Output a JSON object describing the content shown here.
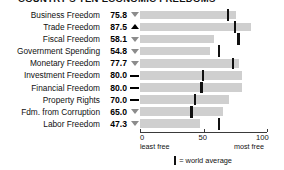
{
  "chart_title": "COUNTRY'S TEN ECONOMIC FREEDOMS",
  "axis": {
    "ticks": [
      {
        "value": 0,
        "label": "0"
      },
      {
        "value": 50,
        "label": "50"
      },
      {
        "value": 100,
        "label": "100"
      }
    ],
    "left_caption": "least free",
    "right_caption": "most free",
    "min": 0,
    "max": 100
  },
  "legend": {
    "marker_name": "world-average-marker",
    "text": "= world average"
  },
  "colors": {
    "bar": "#cfcfcf",
    "average_tick": "#111111",
    "trend_up": "#000000",
    "trend_down": "#8c8c8c",
    "axis": "#3a3a3a",
    "text": "#111111"
  },
  "chart_data": {
    "type": "bar",
    "title": "COUNTRY'S TEN ECONOMIC FREEDOMS",
    "xlabel": "",
    "ylabel": "",
    "xlim": [
      0,
      100
    ],
    "grid": false,
    "orientation": "horizontal",
    "legend_position": "bottom",
    "categories": [
      "Business Freedom",
      "Trade Freedom",
      "Fiscal Freedom",
      "Government Spending",
      "Monetary Freedom",
      "Investment Freedom",
      "Financial Freedom",
      "Property Rights",
      "Fdm. from Corruption",
      "Labor Freedom"
    ],
    "values": [
      75.8,
      87.5,
      58.1,
      54.8,
      77.7,
      80.0,
      80.0,
      70.0,
      65.0,
      47.3
    ],
    "world_average": [
      69.0,
      74.5,
      77.5,
      62.5,
      73.0,
      49.5,
      48.5,
      43.0,
      40.5,
      62.0
    ],
    "trend": [
      "down",
      "up",
      "down",
      "down",
      "down",
      "flat",
      "flat",
      "flat",
      "down",
      "down"
    ],
    "series": [
      {
        "name": "Score",
        "values": [
          75.8,
          87.5,
          58.1,
          54.8,
          77.7,
          80.0,
          80.0,
          70.0,
          65.0,
          47.3
        ]
      },
      {
        "name": "World average",
        "values": [
          69.0,
          74.5,
          77.5,
          62.5,
          73.0,
          49.5,
          48.5,
          43.0,
          40.5,
          62.0
        ]
      }
    ]
  }
}
